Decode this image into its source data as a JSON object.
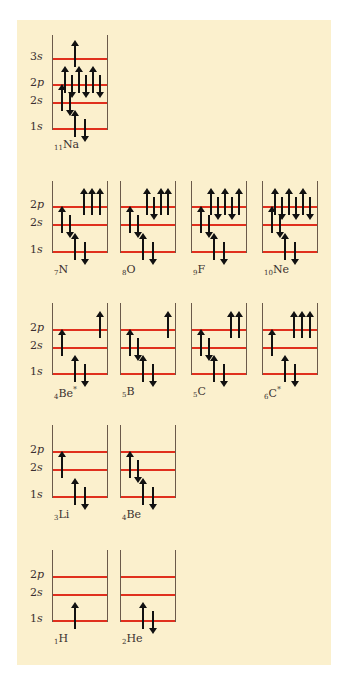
{
  "colors": {
    "background": "#fbf0cd",
    "level_line": "#e0301e",
    "arrow": "#111111",
    "wall": "#6b5a4a"
  },
  "level_labels": {
    "3s": "3s",
    "2p": "2p",
    "2s": "2s",
    "1s": "1s"
  },
  "diagrams": [
    {
      "id": "Na",
      "atomic_number": "11",
      "symbol": "Na",
      "star": "",
      "row": 0,
      "col": 0,
      "levels": [
        "3s",
        "2p",
        "2s",
        "1s"
      ],
      "occupancy": {
        "1s": [
          "up",
          "down"
        ],
        "2s": [
          "up",
          "down"
        ],
        "2p": [
          "up",
          "down",
          "up",
          "down",
          "up",
          "down"
        ],
        "3s": [
          "up"
        ]
      }
    },
    {
      "id": "N",
      "atomic_number": "7",
      "symbol": "N",
      "star": "",
      "row": 1,
      "col": 0,
      "levels": [
        "2p",
        "2s",
        "1s"
      ],
      "occupancy": {
        "1s": [
          "up",
          "down"
        ],
        "2s": [
          "up",
          "down"
        ],
        "2p": [
          "up",
          "up",
          "up"
        ]
      }
    },
    {
      "id": "O",
      "atomic_number": "8",
      "symbol": "O",
      "star": "",
      "row": 1,
      "col": 1,
      "levels": [
        "2p",
        "2s",
        "1s"
      ],
      "occupancy": {
        "1s": [
          "up",
          "down"
        ],
        "2s": [
          "up",
          "down"
        ],
        "2p": [
          "up",
          "down",
          "up",
          "up"
        ]
      }
    },
    {
      "id": "F",
      "atomic_number": "9",
      "symbol": "F",
      "star": "",
      "row": 1,
      "col": 2,
      "levels": [
        "2p",
        "2s",
        "1s"
      ],
      "occupancy": {
        "1s": [
          "up",
          "down"
        ],
        "2s": [
          "up",
          "down"
        ],
        "2p": [
          "up",
          "down",
          "up",
          "down",
          "up"
        ]
      }
    },
    {
      "id": "Ne",
      "atomic_number": "10",
      "symbol": "Ne",
      "star": "",
      "row": 1,
      "col": 3,
      "levels": [
        "2p",
        "2s",
        "1s"
      ],
      "occupancy": {
        "1s": [
          "up",
          "down"
        ],
        "2s": [
          "up",
          "down"
        ],
        "2p": [
          "up",
          "down",
          "up",
          "down",
          "up",
          "down"
        ]
      }
    },
    {
      "id": "Be*",
      "atomic_number": "4",
      "symbol": "Be",
      "star": "*",
      "row": 2,
      "col": 0,
      "levels": [
        "2p",
        "2s",
        "1s"
      ],
      "occupancy": {
        "1s": [
          "up",
          "down"
        ],
        "2s": [
          "up"
        ],
        "2p": [
          "up"
        ]
      }
    },
    {
      "id": "B",
      "atomic_number": "5",
      "symbol": "B",
      "star": "",
      "row": 2,
      "col": 1,
      "levels": [
        "2p",
        "2s",
        "1s"
      ],
      "occupancy": {
        "1s": [
          "up",
          "down"
        ],
        "2s": [
          "up",
          "down"
        ],
        "2p": [
          "up"
        ]
      }
    },
    {
      "id": "C",
      "atomic_number": "5",
      "symbol": "C",
      "star": "",
      "row": 2,
      "col": 2,
      "levels": [
        "2p",
        "2s",
        "1s"
      ],
      "occupancy": {
        "1s": [
          "up",
          "down"
        ],
        "2s": [
          "up",
          "down"
        ],
        "2p": [
          "up",
          "up"
        ]
      }
    },
    {
      "id": "C*",
      "atomic_number": "6",
      "symbol": "C",
      "star": "*",
      "row": 2,
      "col": 3,
      "levels": [
        "2p",
        "2s",
        "1s"
      ],
      "occupancy": {
        "1s": [
          "up",
          "down"
        ],
        "2s": [
          "up"
        ],
        "2p": [
          "up",
          "up",
          "up"
        ]
      }
    },
    {
      "id": "Li",
      "atomic_number": "3",
      "symbol": "Li",
      "star": "",
      "row": 3,
      "col": 0,
      "levels": [
        "2p",
        "2s",
        "1s"
      ],
      "occupancy": {
        "1s": [
          "up",
          "down"
        ],
        "2s": [
          "up"
        ],
        "2p": []
      }
    },
    {
      "id": "Be",
      "atomic_number": "4",
      "symbol": "Be",
      "star": "",
      "row": 3,
      "col": 1,
      "levels": [
        "2p",
        "2s",
        "1s"
      ],
      "occupancy": {
        "1s": [
          "up",
          "down"
        ],
        "2s": [
          "up",
          "down"
        ],
        "2p": []
      }
    },
    {
      "id": "H",
      "atomic_number": "1",
      "symbol": "H",
      "star": "",
      "row": 4,
      "col": 0,
      "levels": [
        "2p",
        "2s",
        "1s"
      ],
      "occupancy": {
        "1s": [
          "up"
        ],
        "2s": [],
        "2p": []
      }
    },
    {
      "id": "He",
      "atomic_number": "2",
      "symbol": "He",
      "star": "",
      "row": 4,
      "col": 1,
      "levels": [
        "2p",
        "2s",
        "1s"
      ],
      "occupancy": {
        "1s": [
          "up",
          "down"
        ],
        "2s": [],
        "2p": []
      }
    }
  ],
  "layout": {
    "col_x": [
      52,
      120,
      191,
      262
    ],
    "box_width": 54,
    "rows": [
      {
        "top": 35,
        "levels": {
          "3s": 59,
          "2p": 85,
          "2s": 103,
          "1s": 129
        },
        "label_y": 138
      },
      {
        "top": 181,
        "levels": {
          "2p": 207,
          "2s": 225,
          "1s": 252
        },
        "label_y": 263
      },
      {
        "top": 303,
        "levels": {
          "2p": 330,
          "2s": 348,
          "1s": 374
        },
        "label_y": 385
      },
      {
        "top": 425,
        "levels": {
          "2p": 452,
          "2s": 470,
          "1s": 497
        },
        "label_y": 508
      },
      {
        "top": 550,
        "levels": {
          "2p": 577,
          "2s": 595,
          "1s": 621
        },
        "label_y": 632
      }
    ]
  }
}
